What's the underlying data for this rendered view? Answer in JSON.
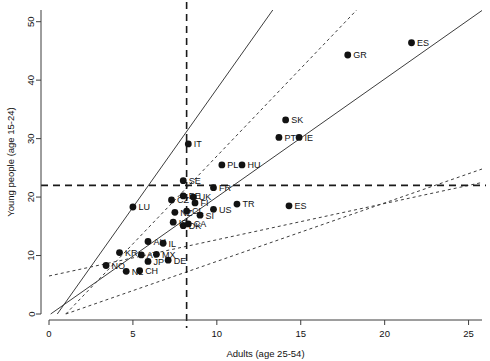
{
  "chart_data": {
    "type": "scatter",
    "title": "",
    "xlabel": "Adults (age 25-54)",
    "ylabel": "Young people (age 15-24)",
    "xlim": [
      0,
      25.8
    ],
    "ylim": [
      0,
      52
    ],
    "xticks": [
      "0",
      "5",
      "10",
      "15",
      "20",
      "25"
    ],
    "xtick_values": [
      0,
      5,
      10,
      15,
      20,
      25
    ],
    "yticks": [
      "0",
      "10",
      "20",
      "30",
      "40",
      "50"
    ],
    "ytick_values": [
      0,
      10,
      20,
      30,
      40,
      50
    ],
    "grid": false,
    "legend": "none",
    "points": [
      {
        "label": "ES",
        "x": 21.6,
        "y": 46.4
      },
      {
        "label": "GR",
        "x": 17.8,
        "y": 44.3
      },
      {
        "label": "SK",
        "x": 14.1,
        "y": 33.2
      },
      {
        "label": "PT",
        "x": 13.7,
        "y": 30.2
      },
      {
        "label": "IE",
        "x": 14.9,
        "y": 30.2
      },
      {
        "label": "IT",
        "x": 8.3,
        "y": 29.1
      },
      {
        "label": "PL",
        "x": 10.3,
        "y": 25.5
      },
      {
        "label": "HU",
        "x": 11.5,
        "y": 25.5
      },
      {
        "label": "SE",
        "x": 8.0,
        "y": 22.8
      },
      {
        "label": "FR",
        "x": 9.8,
        "y": 21.6
      },
      {
        "label": "UK",
        "x": 8.6,
        "y": 20.0
      },
      {
        "label": "BE",
        "x": 8.0,
        "y": 20.2
      },
      {
        "label": "CZ",
        "x": 7.3,
        "y": 19.5
      },
      {
        "label": "FI",
        "x": 8.7,
        "y": 19.0
      },
      {
        "label": "TR",
        "x": 11.2,
        "y": 18.8
      },
      {
        "label": "US",
        "x": 9.8,
        "y": 17.9
      },
      {
        "label": "LU",
        "x": 5.0,
        "y": 18.3
      },
      {
        "label": "NZ",
        "x": 7.5,
        "y": 17.4
      },
      {
        "label": "CL",
        "x": 8.2,
        "y": 17.6
      },
      {
        "label": "SI",
        "x": 9.0,
        "y": 16.9
      },
      {
        "label": "IS",
        "x": 7.4,
        "y": 15.7
      },
      {
        "label": "CA",
        "x": 8.3,
        "y": 15.4
      },
      {
        "label": "DK",
        "x": 8.0,
        "y": 15.1
      },
      {
        "label": "ES",
        "x": 14.3,
        "y": 18.5
      },
      {
        "label": "AU",
        "x": 5.9,
        "y": 12.4
      },
      {
        "label": "IL",
        "x": 6.8,
        "y": 12.1
      },
      {
        "label": "KR",
        "x": 4.2,
        "y": 10.5
      },
      {
        "label": "AT",
        "x": 5.5,
        "y": 10.1
      },
      {
        "label": "MX",
        "x": 6.4,
        "y": 10.2
      },
      {
        "label": "JP",
        "x": 5.9,
        "y": 9.0
      },
      {
        "label": "DE",
        "x": 7.1,
        "y": 9.2
      },
      {
        "label": "NO",
        "x": 3.4,
        "y": 8.3
      },
      {
        "label": "NL",
        "x": 4.6,
        "y": 7.3
      },
      {
        "label": "CH",
        "x": 5.4,
        "y": 7.4
      }
    ],
    "annotations": {
      "vertical_reference": 8.2,
      "horizontal_reference": 22.0,
      "reference_lines": [
        {
          "style": "solid",
          "slope": 4.05,
          "intercept": -2.0
        },
        {
          "style": "dashed",
          "slope": 3.0,
          "intercept": -3.0
        },
        {
          "style": "solid",
          "slope": 2.02,
          "intercept": -0.2
        },
        {
          "style": "dashed",
          "slope": 1.0,
          "intercept": -1.0
        },
        {
          "style": "dashed",
          "slope": 0.62,
          "intercept": 6.5
        }
      ]
    }
  }
}
